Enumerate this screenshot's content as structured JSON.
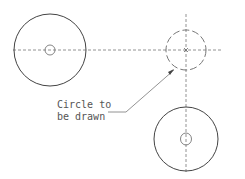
{
  "diagram": {
    "annotation": {
      "line1": "Circle to",
      "line2": "be drawn"
    },
    "colors": {
      "solid": "#444444",
      "dashed": "#666666",
      "text": "#555555"
    }
  }
}
